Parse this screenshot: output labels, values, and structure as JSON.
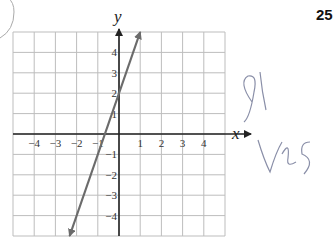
{
  "problem_number": "25",
  "handwriting": [
    "gl",
    "yes"
  ],
  "chart_data": {
    "type": "line",
    "title": "",
    "xlabel": "x",
    "ylabel": "y",
    "xlim": [
      -5,
      5
    ],
    "ylim": [
      -5,
      5
    ],
    "grid": true,
    "x_ticks": [
      "-4",
      "-3",
      "-2",
      "-1",
      "1",
      "2",
      "3",
      "4"
    ],
    "y_ticks": [
      "4",
      "3",
      "2",
      "1",
      "-1",
      "-2",
      "-3",
      "-4"
    ],
    "series": [
      {
        "name": "line",
        "equation": "y = 3x + 2",
        "x": [
          -2.33,
          1.0
        ],
        "y": [
          -5,
          5
        ],
        "color": "#6b6b6b",
        "arrows": "both"
      }
    ]
  },
  "colors": {
    "grid": "#bdbdbd",
    "axis": "#222222",
    "line": "#6b6b6b",
    "ink": "#8a8fa8"
  }
}
